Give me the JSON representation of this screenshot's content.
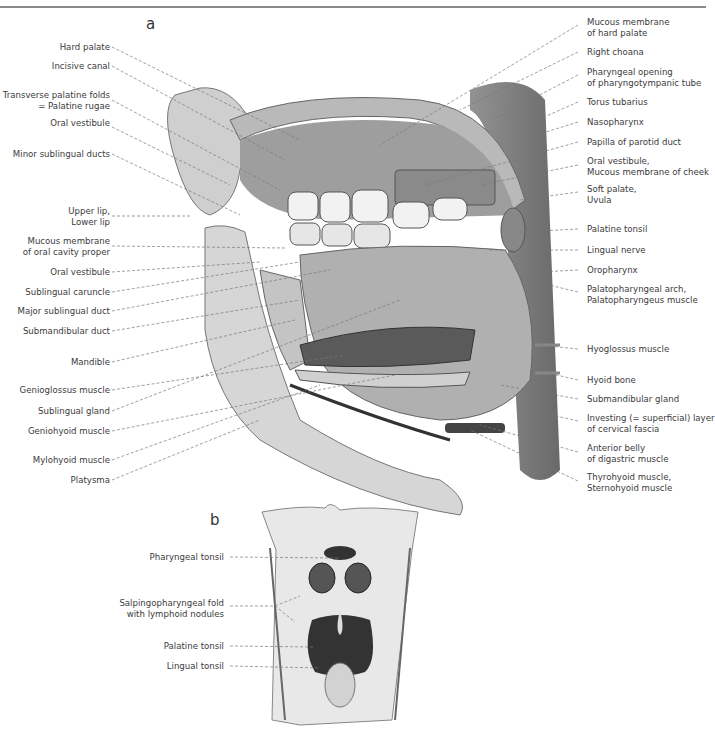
{
  "figure": {
    "panel_a_letter": "a",
    "panel_b_letter": "b",
    "panel_a": {
      "left_labels": [
        {
          "lines": [
            "Hard palate"
          ],
          "y": 47
        },
        {
          "lines": [
            "Incisive canal"
          ],
          "y": 66
        },
        {
          "lines": [
            "Transverse palatine folds",
            "= Palatine rugae"
          ],
          "y": 95
        },
        {
          "lines": [
            "Oral vestibule"
          ],
          "y": 123
        },
        {
          "lines": [
            "Minor sublingual ducts"
          ],
          "y": 154
        },
        {
          "lines": [
            "Upper lip,",
            "Lower lip"
          ],
          "y": 210
        },
        {
          "lines": [
            "Mucous membrane",
            "of oral cavity proper"
          ],
          "y": 241
        },
        {
          "lines": [
            "Oral vestibule"
          ],
          "y": 272
        },
        {
          "lines": [
            "Sublingual caruncle"
          ],
          "y": 292
        },
        {
          "lines": [
            "Major sublingual duct"
          ],
          "y": 311
        },
        {
          "lines": [
            "Submandibular duct"
          ],
          "y": 331
        },
        {
          "lines": [
            "Mandible"
          ],
          "y": 362
        },
        {
          "lines": [
            "Genioglossus muscle"
          ],
          "y": 390
        },
        {
          "lines": [
            "Sublingual gland"
          ],
          "y": 411
        },
        {
          "lines": [
            "Geniohyoid muscle"
          ],
          "y": 431
        },
        {
          "lines": [
            "Mylohyoid muscle"
          ],
          "y": 460
        },
        {
          "lines": [
            "Platysma"
          ],
          "y": 480
        }
      ],
      "right_labels": [
        {
          "lines": [
            "Mucous membrane",
            "of hard palate"
          ],
          "y": 22
        },
        {
          "lines": [
            "Right choana"
          ],
          "y": 52
        },
        {
          "lines": [
            "Pharyngeal opening",
            "of pharyngotympanic tube"
          ],
          "y": 72
        },
        {
          "lines": [
            "Torus tubarius"
          ],
          "y": 102
        },
        {
          "lines": [
            "Nasopharynx"
          ],
          "y": 122
        },
        {
          "lines": [
            "Papilla of parotid duct"
          ],
          "y": 142
        },
        {
          "lines": [
            "Oral vestibule,",
            "Mucous membrane of cheek"
          ],
          "y": 161
        },
        {
          "lines": [
            "Soft palate,",
            "Uvula"
          ],
          "y": 189
        },
        {
          "lines": [
            "Palatine tonsil"
          ],
          "y": 229
        },
        {
          "lines": [
            "Lingual nerve"
          ],
          "y": 250
        },
        {
          "lines": [
            "Oropharynx"
          ],
          "y": 270
        },
        {
          "lines": [
            "Palatopharyngeal arch,",
            "Palatopharyngeus muscle"
          ],
          "y": 289
        },
        {
          "lines": [
            "Hyoglossus muscle"
          ],
          "y": 349
        },
        {
          "lines": [
            "Hyoid bone"
          ],
          "y": 380
        },
        {
          "lines": [
            "Submandibular gland"
          ],
          "y": 399
        },
        {
          "lines": [
            "Investing (= superficial) layer",
            "of cervical fascia"
          ],
          "y": 418
        },
        {
          "lines": [
            "Anterior belly",
            "of digastric muscle"
          ],
          "y": 448
        },
        {
          "lines": [
            "Thyrohyoid muscle,",
            "Sternohyoid muscle"
          ],
          "y": 477
        }
      ]
    },
    "panel_b": {
      "left_labels": [
        {
          "lines": [
            "Pharyngeal tonsil"
          ],
          "y": 554
        },
        {
          "lines": [
            "Salpingopharyngeal fold",
            "with lymphoid nodules"
          ],
          "y": 603
        },
        {
          "lines": [
            "Palatine tonsil"
          ],
          "y": 643
        },
        {
          "lines": [
            "Lingual tonsil"
          ],
          "y": 663
        }
      ]
    }
  }
}
